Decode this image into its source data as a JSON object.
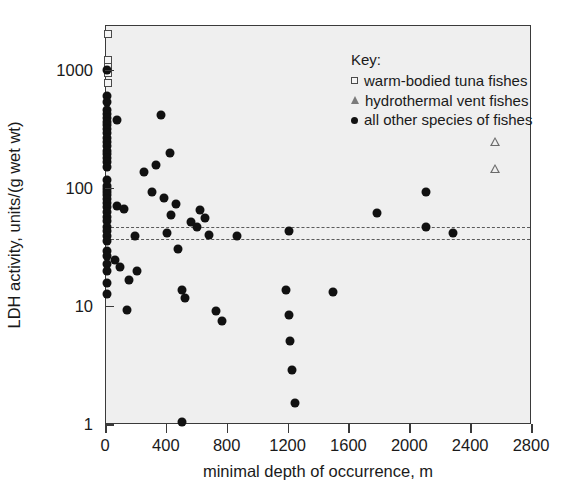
{
  "chart_data": {
    "type": "scatter",
    "title": "",
    "xlabel": "minimal depth of occurrence, m",
    "ylabel": "LDH activity, units/(g wet wt)",
    "xlim": [
      0,
      2800
    ],
    "ylim": [
      1,
      2400
    ],
    "yscale": "log",
    "xticks": [
      0,
      400,
      800,
      1200,
      1600,
      2000,
      2400,
      2800
    ],
    "xtick_labels": [
      "0",
      "400",
      "800",
      "1200",
      "1600",
      "2000",
      "2400",
      "2800"
    ],
    "yticks": [
      1,
      10,
      100,
      1000
    ],
    "ytick_labels": [
      "1",
      "10",
      "100",
      "1000"
    ],
    "grid": false,
    "legend_position": "top-right",
    "legend_title": "Key:",
    "reference_lines": [
      {
        "type": "hline",
        "y": 48,
        "style": "dashed"
      },
      {
        "type": "hline",
        "y": 38,
        "style": "dashed"
      }
    ],
    "series": [
      {
        "name": "warm-bodied tuna fishes",
        "marker": "open-square",
        "points": [
          [
            10,
            2050
          ],
          [
            10,
            1230
          ],
          [
            10,
            1080
          ],
          [
            10,
            960
          ],
          [
            10,
            790
          ]
        ]
      },
      {
        "name": "hydrothermal vent fishes",
        "marker": "open-triangle",
        "points": [
          [
            2560,
            250
          ],
          [
            2560,
            148
          ]
        ]
      },
      {
        "name": "all other species of fishes",
        "marker": "filled-circle",
        "points": [
          [
            8,
            1010
          ],
          [
            8,
            610
          ],
          [
            8,
            540
          ],
          [
            8,
            470
          ],
          [
            8,
            430
          ],
          [
            8,
            400
          ],
          [
            8,
            370
          ],
          [
            8,
            345
          ],
          [
            8,
            320
          ],
          [
            8,
            300
          ],
          [
            8,
            270
          ],
          [
            8,
            250
          ],
          [
            8,
            230
          ],
          [
            8,
            210
          ],
          [
            8,
            196
          ],
          [
            8,
            182
          ],
          [
            8,
            168
          ],
          [
            8,
            152
          ],
          [
            8,
            120
          ],
          [
            8,
            106
          ],
          [
            8,
            100
          ],
          [
            8,
            95
          ],
          [
            8,
            88
          ],
          [
            8,
            82
          ],
          [
            8,
            76
          ],
          [
            8,
            70
          ],
          [
            8,
            64
          ],
          [
            8,
            58
          ],
          [
            8,
            53
          ],
          [
            8,
            48
          ],
          [
            8,
            44
          ],
          [
            8,
            40
          ],
          [
            8,
            36
          ],
          [
            8,
            30
          ],
          [
            8,
            27
          ],
          [
            8,
            23
          ],
          [
            8,
            20
          ],
          [
            8,
            16
          ],
          [
            8,
            13
          ],
          [
            70,
            380
          ],
          [
            70,
            72
          ],
          [
            120,
            68
          ],
          [
            150,
            17
          ],
          [
            190,
            40
          ],
          [
            60,
            25
          ],
          [
            95,
            22
          ],
          [
            140,
            9.4
          ],
          [
            205,
            20
          ],
          [
            250,
            140
          ],
          [
            330,
            160
          ],
          [
            360,
            420
          ],
          [
            420,
            200
          ],
          [
            300,
            95
          ],
          [
            380,
            83
          ],
          [
            430,
            60
          ],
          [
            460,
            75
          ],
          [
            400,
            42
          ],
          [
            470,
            31
          ],
          [
            500,
            14
          ],
          [
            520,
            12
          ],
          [
            560,
            52
          ],
          [
            600,
            48
          ],
          [
            620,
            66
          ],
          [
            650,
            57
          ],
          [
            680,
            41
          ],
          [
            720,
            9.3
          ],
          [
            760,
            7.6
          ],
          [
            500,
            1.05
          ],
          [
            860,
            40
          ],
          [
            1180,
            14
          ],
          [
            1200,
            44
          ],
          [
            1200,
            8.5
          ],
          [
            1210,
            5.1
          ],
          [
            1220,
            2.9
          ],
          [
            1240,
            1.55
          ],
          [
            1490,
            13.5
          ],
          [
            1780,
            63
          ],
          [
            2100,
            95
          ],
          [
            2100,
            48
          ],
          [
            2280,
            42
          ]
        ]
      }
    ]
  }
}
